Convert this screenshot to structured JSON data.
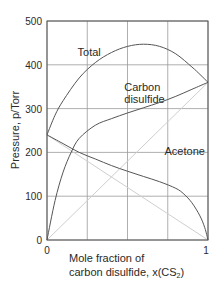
{
  "chart_data": {
    "type": "line",
    "title": "",
    "xlabel": "Mole fraction of carbon disulfide, x(CS2)",
    "xlabel_lines": [
      "Mole fraction of",
      "carbon disulfide, x(CS",
      "2",
      ")"
    ],
    "ylabel": "Pressure, p/Torr",
    "xlim": [
      0,
      1
    ],
    "ylim": [
      0,
      500
    ],
    "x_ticks": [
      "0",
      "1"
    ],
    "y_ticks": [
      "0",
      "100",
      "200",
      "300",
      "400",
      "500"
    ],
    "grid": true,
    "grid_x": [
      0,
      0.25,
      0.5,
      0.75,
      1
    ],
    "grid_y": [
      0,
      100,
      200,
      300,
      400,
      500
    ],
    "series": [
      {
        "name": "Total",
        "x": [
          0,
          0.05,
          0.1,
          0.2,
          0.3,
          0.4,
          0.5,
          0.6,
          0.7,
          0.8,
          0.9,
          0.95,
          1
        ],
        "values": [
          240,
          285,
          318,
          370,
          405,
          428,
          442,
          447,
          442,
          425,
          395,
          378,
          360
        ]
      },
      {
        "name": "Carbon disulfide",
        "x": [
          0,
          0.05,
          0.1,
          0.15,
          0.2,
          0.3,
          0.4,
          0.5,
          0.6,
          0.7,
          0.8,
          0.9,
          1
        ],
        "values": [
          0,
          90,
          155,
          200,
          232,
          262,
          277,
          290,
          302,
          314,
          328,
          344,
          360
        ]
      },
      {
        "name": "Acetone",
        "x": [
          0,
          0.1,
          0.2,
          0.3,
          0.4,
          0.5,
          0.6,
          0.7,
          0.8,
          0.85,
          0.9,
          0.95,
          0.98,
          1
        ],
        "values": [
          240,
          220,
          200,
          185,
          170,
          157,
          145,
          133,
          118,
          105,
          85,
          55,
          28,
          0
        ]
      },
      {
        "name": "Raoult ideal CS2",
        "style": "ideal",
        "x": [
          0,
          1
        ],
        "values": [
          0,
          360
        ]
      },
      {
        "name": "Raoult ideal acetone",
        "style": "ideal",
        "x": [
          0,
          1
        ],
        "values": [
          240,
          0
        ]
      }
    ],
    "annotations": [
      {
        "text": "Total",
        "x": 0.19,
        "y": 420
      },
      {
        "text": "Carbon",
        "x": 0.48,
        "y": 340
      },
      {
        "text": "disulfide",
        "x": 0.48,
        "y": 312
      },
      {
        "text": "Acetone",
        "x": 0.73,
        "y": 195
      }
    ]
  },
  "colors": {
    "curve": "#555555",
    "ideal": "#cfcfcf",
    "grid": "#9a9a9a",
    "text": "#2a2a2a"
  }
}
